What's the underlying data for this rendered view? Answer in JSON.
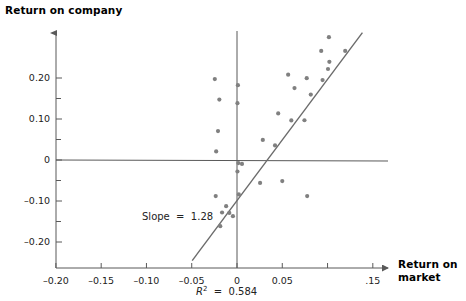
{
  "chart_data": {
    "type": "scatter",
    "title": "",
    "xlabel": "Return on market",
    "ylabel": "Return on company",
    "xlim": [
      -0.2,
      0.155
    ],
    "ylim": [
      -0.245,
      0.33
    ],
    "grid": false,
    "legend": "none",
    "x_ticks": [
      {
        "value": -0.2,
        "label": "–0.20"
      },
      {
        "value": -0.15,
        "label": "–0.15"
      },
      {
        "value": -0.1,
        "label": "–0.10"
      },
      {
        "value": -0.05,
        "label": "–0.05"
      },
      {
        "value": 0.0,
        "label": "0"
      },
      {
        "value": 0.05,
        "label": "0.05"
      },
      {
        "value": 0.1,
        "label": ""
      },
      {
        "value": 0.15,
        "label": ".15"
      }
    ],
    "y_ticks": [
      {
        "value": 0.2,
        "label": "0.20"
      },
      {
        "value": 0.15,
        "label": ""
      },
      {
        "value": 0.1,
        "label": "0.10"
      },
      {
        "value": 0.05,
        "label": ""
      },
      {
        "value": 0.0,
        "label": "0"
      },
      {
        "value": -0.05,
        "label": ""
      },
      {
        "value": -0.1,
        "label": "–0.10"
      },
      {
        "value": -0.15,
        "label": ""
      },
      {
        "value": -0.2,
        "label": "–0.20"
      }
    ],
    "reference_lines": [
      {
        "name": "zero-horizontal",
        "orientation": "horizontal",
        "value": 0.0
      },
      {
        "name": "zero-vertical",
        "orientation": "vertical",
        "value": 0.0
      }
    ],
    "fit_line": {
      "name": "regression-line",
      "slope": 1.28,
      "x_start": -0.0495,
      "y_start": -0.2455,
      "x_end": 0.1385,
      "y_end": 0.3105
    },
    "points": [
      {
        "x": -0.0245,
        "y": 0.1975
      },
      {
        "x": -0.0195,
        "y": 0.1475
      },
      {
        "x": -0.021,
        "y": 0.0705
      },
      {
        "x": -0.023,
        "y": 0.021
      },
      {
        "x": -0.0235,
        "y": -0.088
      },
      {
        "x": -0.0165,
        "y": -0.128
      },
      {
        "x": -0.0185,
        "y": -0.1615
      },
      {
        "x": -0.012,
        "y": -0.1125
      },
      {
        "x": -0.0085,
        "y": -0.129
      },
      {
        "x": -0.0045,
        "y": -0.137
      },
      {
        "x": 0.001,
        "y": 0.1825
      },
      {
        "x": 0.0005,
        "y": 0.1385
      },
      {
        "x": 0.0015,
        "y": -0.0075
      },
      {
        "x": 0.0055,
        "y": -0.0095
      },
      {
        "x": 0.0005,
        "y": -0.028
      },
      {
        "x": 0.002,
        "y": -0.084
      },
      {
        "x": 0.0285,
        "y": 0.049
      },
      {
        "x": 0.0255,
        "y": -0.056
      },
      {
        "x": 0.042,
        "y": 0.0355
      },
      {
        "x": 0.0455,
        "y": 0.1135
      },
      {
        "x": 0.05,
        "y": -0.0515
      },
      {
        "x": 0.0565,
        "y": 0.208
      },
      {
        "x": 0.06,
        "y": 0.0965
      },
      {
        "x": 0.0635,
        "y": 0.1755
      },
      {
        "x": 0.0745,
        "y": 0.097
      },
      {
        "x": 0.077,
        "y": 0.1995
      },
      {
        "x": 0.0815,
        "y": 0.1595
      },
      {
        "x": 0.0775,
        "y": -0.088
      },
      {
        "x": 0.0945,
        "y": 0.195
      },
      {
        "x": 0.093,
        "y": 0.266
      },
      {
        "x": 0.1005,
        "y": 0.222
      },
      {
        "x": 0.102,
        "y": 0.2395
      },
      {
        "x": 0.1015,
        "y": 0.2995
      },
      {
        "x": 0.1195,
        "y": 0.266
      }
    ],
    "annotations": [
      {
        "name": "slope-annotation",
        "text": "Slope  =  1.28"
      },
      {
        "name": "r2-annotation",
        "text": "R2  =  0.584",
        "r_symbol": "R",
        "exponent": "2",
        "equals": "  =  ",
        "value": "0.584"
      }
    ],
    "colors": {
      "point": "#808080",
      "axis": "#595959",
      "fit_line": "#6b6b6b",
      "text": "#1a1a1a"
    }
  }
}
